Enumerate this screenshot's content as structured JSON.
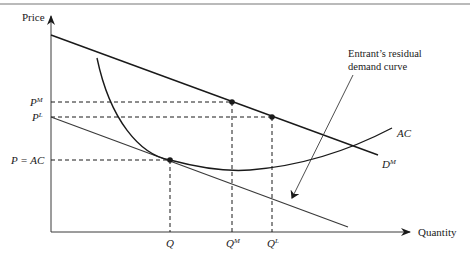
{
  "figure": {
    "type": "economics-diagram",
    "axes": {
      "y_label": "Price",
      "x_label": "Quantity"
    },
    "price_labels": {
      "pm": {
        "base": "P",
        "sup": "M"
      },
      "pl": {
        "base": "P",
        "sup": "L"
      },
      "pac": "P = AC"
    },
    "quantity_labels": {
      "q": "Q",
      "qm": {
        "base": "Q",
        "sup": "M"
      },
      "ql": {
        "base": "Q",
        "sup": "L"
      }
    },
    "curves": {
      "market_demand": {
        "base": "D",
        "sup": "M"
      },
      "average_cost": "AC",
      "residual_demand_annotation_line1": "Entrant’s residual",
      "residual_demand_annotation_line2": "demand curve"
    },
    "colors": {
      "line": "#1a1a1a",
      "thin_line": "#3a3a3a",
      "border": "#777777"
    }
  }
}
